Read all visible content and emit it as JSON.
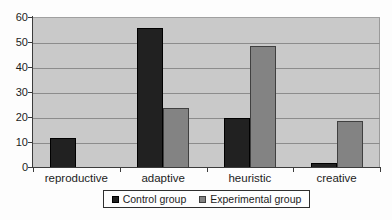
{
  "chart_data": {
    "type": "bar",
    "title": "",
    "xlabel": "",
    "ylabel": "",
    "categories": [
      "reproductive",
      "adaptive",
      "heuristic",
      "creative"
    ],
    "series": [
      {
        "name": "Control group",
        "color": "#212121",
        "border_color": "#000000",
        "values": [
          12,
          56,
          20,
          2
        ]
      },
      {
        "name": "Experimental group",
        "color": "#838383",
        "border_color": "#404040",
        "values": [
          0,
          24,
          49,
          19
        ]
      }
    ],
    "ylim": [
      0,
      60
    ],
    "yticks": [
      0,
      10,
      20,
      30,
      40,
      50,
      60
    ],
    "grid": true,
    "legend_position": "bottom-center",
    "plot_background": "#c9c9c9",
    "gridline_color": "#8c8c8c",
    "axis_color": "#3c3c3c"
  }
}
